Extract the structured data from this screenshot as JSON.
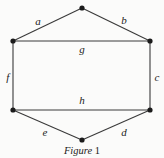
{
  "figure": {
    "caption_text": "Figure",
    "caption_number": "1",
    "shape": "hexagon",
    "colors": {
      "background": "#fbfbfa",
      "stroke": "#3a3a3a",
      "vertex": "#1b1b1b",
      "text": "#1b1b1b"
    },
    "vertices": [
      {
        "name": "top",
        "x": 82,
        "y": 8
      },
      {
        "name": "upper-right",
        "x": 150,
        "y": 41
      },
      {
        "name": "lower-right",
        "x": 150,
        "y": 110
      },
      {
        "name": "bottom",
        "x": 82,
        "y": 140
      },
      {
        "name": "lower-left",
        "x": 13,
        "y": 110
      },
      {
        "name": "upper-left",
        "x": 13,
        "y": 41
      }
    ],
    "edges": [
      {
        "id": "a",
        "label": "a",
        "from": "upper-left",
        "to": "top",
        "label_x": 38,
        "label_y": 21
      },
      {
        "id": "b",
        "label": "b",
        "from": "top",
        "to": "upper-right",
        "label_x": 124,
        "label_y": 20
      },
      {
        "id": "c",
        "label": "c",
        "from": "upper-right",
        "to": "lower-right",
        "label_x": 157,
        "label_y": 77
      },
      {
        "id": "d",
        "label": "d",
        "from": "lower-right",
        "to": "bottom",
        "label_x": 124,
        "label_y": 132
      },
      {
        "id": "e",
        "label": "e",
        "from": "bottom",
        "to": "lower-left",
        "label_x": 45,
        "label_y": 132
      },
      {
        "id": "f",
        "label": "f",
        "from": "lower-left",
        "to": "upper-left",
        "label_x": 8,
        "label_y": 77
      }
    ],
    "chords": [
      {
        "id": "g",
        "label": "g",
        "from": "upper-left",
        "to": "upper-right",
        "label_x": 82,
        "label_y": 49
      },
      {
        "id": "h",
        "label": "h",
        "from": "lower-left",
        "to": "lower-right",
        "label_x": 82,
        "label_y": 100
      }
    ]
  }
}
